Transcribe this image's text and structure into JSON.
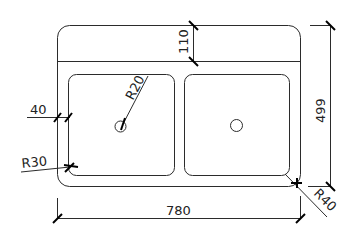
{
  "drawing": {
    "title": "Double bowl sink plan view",
    "units": "mm",
    "colors": {
      "line": "#2b2b2b",
      "tick": "#000000",
      "text": "#222222",
      "background": "#ffffff"
    },
    "dimensions": {
      "overall_width": "780",
      "overall_depth": "499",
      "back_ledge": "110",
      "side_margin": "40",
      "drain_radius": "R20",
      "bowl_corner_radius": "R30",
      "outer_corner_radius": "R40"
    },
    "components": {
      "outer_outline": "sink-outline",
      "back_ledge_line": "ledge-divider",
      "left_bowl": "bowl-left",
      "right_bowl": "bowl-right",
      "left_drain": "drain-left",
      "right_drain": "drain-right"
    }
  }
}
